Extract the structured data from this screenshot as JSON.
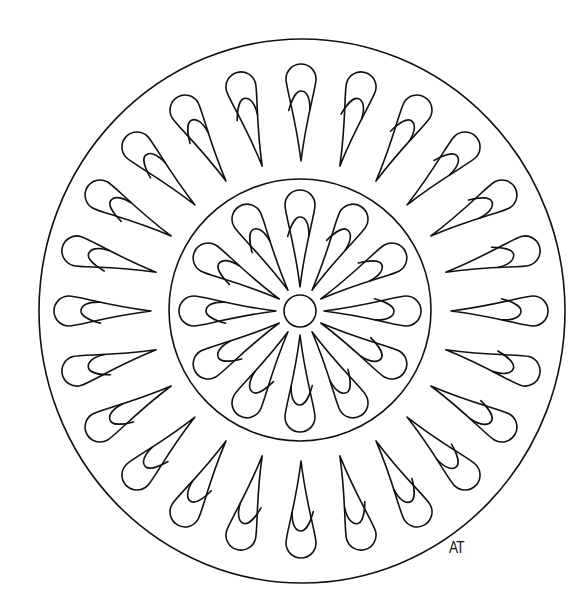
{
  "artwork": {
    "title": "Mandala coloring page",
    "signature": "AT",
    "stroke_color": "#111111",
    "background_color": "#ffffff",
    "outer_ring": {
      "cx": 302,
      "cy": 311,
      "rx": 263,
      "ry": 272
    },
    "inner_ring": {
      "cx": 300,
      "cy": 310,
      "r": 131
    },
    "center_circle": {
      "cx": 300,
      "cy": 311,
      "r": 16
    },
    "outer_petals": {
      "count": 24,
      "start_angle_deg": 0,
      "tip_radius": 150,
      "end_radius": 247,
      "half_width": 15,
      "cx": 301,
      "cy": 311
    },
    "inner_petals": {
      "count": 12,
      "start_angle_deg": 0,
      "tip_radius": 24,
      "end_radius": 121,
      "half_width": 15,
      "cx": 300,
      "cy": 311
    }
  }
}
